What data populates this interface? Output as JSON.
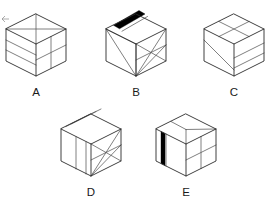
{
  "figure": {
    "type": "isometric-cube-set",
    "background_color": "#ffffff",
    "edge_color": "#2b2b2b",
    "interior_line_color": "#555555",
    "stripe_color": "#000000",
    "label_color": "#1a1a1a",
    "canvas": {
      "width": 273,
      "height": 204
    }
  },
  "cubes": [
    {
      "id": "A",
      "label": "A",
      "label_x": 36,
      "label_y": 96,
      "center_x": 36,
      "center_y": 45,
      "half_width": 30,
      "top_half_height": 15,
      "side_height": 32,
      "has_black_stripe": false,
      "top_face_pattern": "cross-quadrants",
      "left_face_pattern": "two-horizontal-bands",
      "right_face_pattern": "vertical-and-horizontal-split",
      "description": "Top face split into four by a vertical and a horizontal diagonal; left face has two horizontal bands; right face divided by one vertical and one horizontal line."
    },
    {
      "id": "B",
      "label": "B",
      "label_x": 136,
      "label_y": 96,
      "center_x": 136,
      "center_y": 45,
      "half_width": 30,
      "top_half_height": 15,
      "side_height": 32,
      "has_black_stripe": true,
      "stripe_face": "top",
      "top_face_pattern": "black-diagonal-stripe-with-parallel-line",
      "left_face_pattern": "two-diagonals-to-bottom-vertex",
      "right_face_pattern": "x-diagonals",
      "description": "Top face carries a thick black stripe parallel to the upper-right edge plus a thin parallel line; left face has diagonals converging at the bottom vertex; right face has crossing diagonals."
    },
    {
      "id": "C",
      "label": "C",
      "label_x": 234,
      "label_y": 96,
      "center_x": 234,
      "center_y": 45,
      "half_width": 30,
      "top_half_height": 15,
      "side_height": 32,
      "has_black_stripe": false,
      "top_face_pattern": "four-quadrants",
      "left_face_pattern": "single-diagonal",
      "right_face_pattern": "two-horizontal-bands",
      "description": "Top face divided into four quadrants; left face crossed by a single diagonal; right face has two horizontal bands."
    },
    {
      "id": "D",
      "label": "D",
      "label_x": 91,
      "label_y": 196,
      "center_x": 91,
      "center_y": 145,
      "half_width": 30,
      "top_half_height": 15,
      "side_height": 32,
      "has_black_stripe": false,
      "top_face_pattern": "two-parallel-bands",
      "left_face_pattern": "two-vertical-bands",
      "right_face_pattern": "x-diagonals-with-edge-diagonal",
      "description": "Top face banded by two parallel lines; left face split by two vertical lines; right face carries crossing diagonals."
    },
    {
      "id": "E",
      "label": "E",
      "label_x": 186,
      "label_y": 196,
      "center_x": 186,
      "center_y": 145,
      "half_width": 30,
      "top_half_height": 15,
      "side_height": 32,
      "has_black_stripe": true,
      "stripe_face": "left",
      "top_face_pattern": "single-diagonal-split",
      "left_face_pattern": "black-vertical-stripe",
      "right_face_pattern": "vertical-and-horizontal-split",
      "description": "Top face split by one line; left face bears a thick black vertical stripe near its left edge; right face divided by a vertical and a horizontal line."
    }
  ],
  "labels": {
    "a": "A",
    "b": "B",
    "c": "C",
    "d": "D",
    "e": "E"
  }
}
